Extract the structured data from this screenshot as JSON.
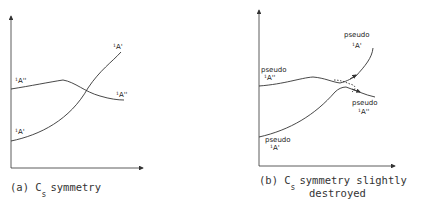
{
  "panel_a": {
    "caption_prefix": "(a) C",
    "caption_sub": "s",
    "caption_suffix": "symmetry",
    "labels": {
      "upper_left": {
        "sup": "1",
        "main": "A''"
      },
      "lower_left": {
        "sup": "1",
        "main": "A'"
      },
      "upper_right": {
        "sup": "1",
        "main": "A'"
      },
      "lower_right": {
        "sup": "1",
        "main": "A''"
      }
    }
  },
  "panel_b": {
    "caption_prefix": "(b) C",
    "caption_sub": "s",
    "caption_suffix": "symmetry slightly",
    "caption_line2": "destroyed",
    "labels": {
      "upper_left": {
        "prefix": "pseudo",
        "sup": "1",
        "main": "A''"
      },
      "lower_left": {
        "prefix": "pseudo",
        "sup": "1",
        "main": "A'"
      },
      "upper_right": {
        "prefix": "pseudo",
        "sup": "1",
        "main": "A'"
      },
      "lower_right": {
        "prefix": "pseudo",
        "sup": "1",
        "main": "A''"
      }
    }
  }
}
